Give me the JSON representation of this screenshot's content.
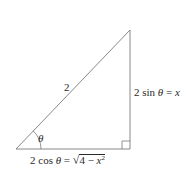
{
  "figure": {
    "type": "right-triangle",
    "colors": {
      "stroke": "#7a7a7a",
      "text": "#2a2a2a",
      "background": "#ffffff"
    },
    "vertices": {
      "bottom_left": [
        16,
        149
      ],
      "apex": [
        130,
        30
      ],
      "right_angle": [
        130,
        149
      ]
    },
    "angle_label": "θ",
    "hypotenuse_label": "2",
    "opposite_label": {
      "coef": "2 sin ",
      "var": "θ",
      "eq": " = ",
      "rhs": "x"
    },
    "adjacent_label": {
      "coef": "2 cos ",
      "var": "θ",
      "eq": " = ",
      "radical": "√",
      "radicand_pre": "4 − ",
      "radicand_var": "x",
      "radicand_exp": "2"
    }
  }
}
